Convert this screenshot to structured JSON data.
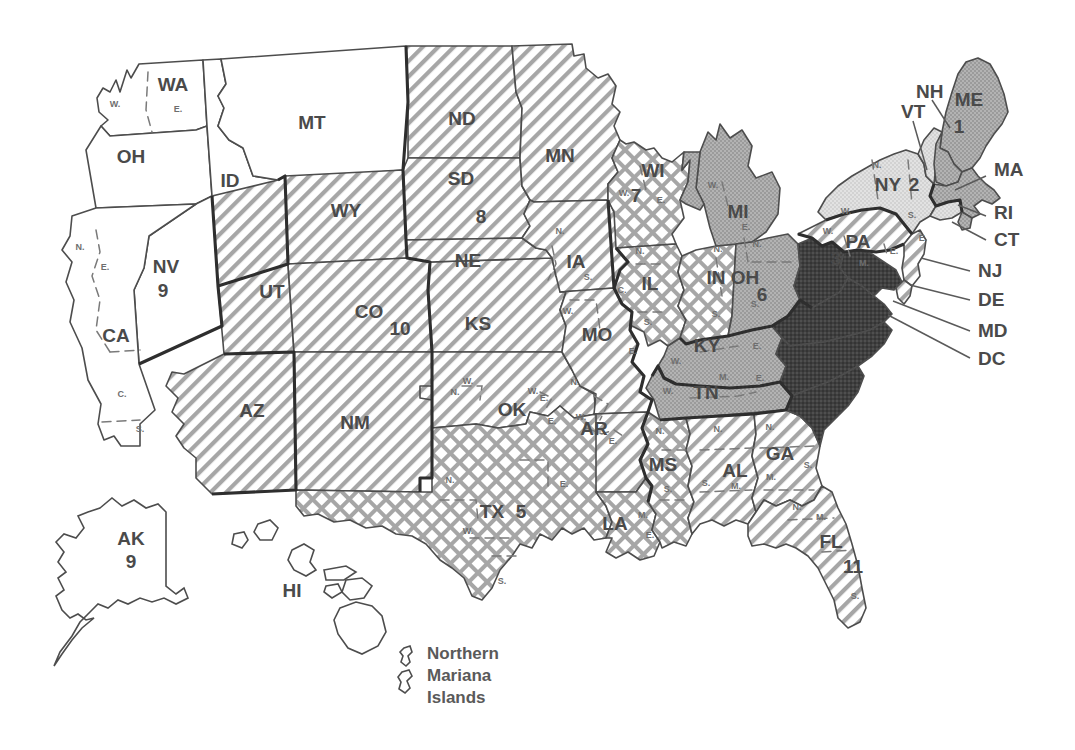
{
  "figure": {
    "kind": "map",
    "background_color": "#ffffff",
    "line_color": "#4d4d4d",
    "circuit_border_color": "#2e2e2e"
  },
  "fills": {
    "white": {
      "name": "plain-white",
      "color": "#ffffff"
    },
    "hatch": {
      "name": "diagonal-hatch",
      "color": "#9a9a9a"
    },
    "crosshatch": {
      "name": "cross-hatch",
      "color": "#9a9a9a"
    },
    "lightgray": {
      "name": "light-gray",
      "color": "#dcdcdc"
    },
    "midgray": {
      "name": "medium-gray",
      "color": "#a8a8a8"
    },
    "dark": {
      "name": "near-black",
      "color": "#3c3c3c"
    }
  },
  "circuits": [
    {
      "number": "1",
      "fill": "midgray",
      "states": [
        "ME",
        "NH",
        "MA",
        "RI",
        "PR"
      ]
    },
    {
      "number": "2",
      "fill": "lightgray",
      "states": [
        "NY",
        "VT",
        "CT"
      ]
    },
    {
      "number": "3",
      "fill": "hatch",
      "states": [
        "PA",
        "NJ",
        "DE"
      ]
    },
    {
      "number": "4",
      "fill": "dark",
      "states": [
        "WV",
        "VA",
        "MD",
        "DC",
        "NC",
        "SC"
      ]
    },
    {
      "number": "5",
      "fill": "crosshatch",
      "states": [
        "TX",
        "LA",
        "MS"
      ]
    },
    {
      "number": "6",
      "fill": "midgray",
      "states": [
        "MI",
        "OH",
        "KY",
        "TN"
      ]
    },
    {
      "number": "7",
      "fill": "crosshatch",
      "states": [
        "WI",
        "IL",
        "IN"
      ]
    },
    {
      "number": "8",
      "fill": "hatch",
      "states": [
        "ND",
        "SD",
        "NE",
        "MN",
        "IA",
        "MO",
        "AR"
      ]
    },
    {
      "number": "9",
      "fill": "white",
      "states": [
        "WA",
        "OR",
        "ID",
        "MT",
        "NV",
        "CA",
        "AK",
        "HI",
        "GU",
        "MP"
      ]
    },
    {
      "number": "10",
      "fill": "hatch",
      "states": [
        "WY",
        "UT",
        "CO",
        "NM",
        "AZ",
        "KS",
        "OK"
      ]
    },
    {
      "number": "11",
      "fill": "hatch",
      "states": [
        "AL",
        "GA",
        "FL"
      ]
    }
  ],
  "circuit_numbers": [
    {
      "label": "1",
      "x": 959,
      "y": 128
    },
    {
      "label": "2",
      "x": 914,
      "y": 186
    },
    {
      "label": "3",
      "x": 836,
      "y": 260
    },
    {
      "label": "5",
      "x": 521,
      "y": 513
    },
    {
      "label": "6",
      "x": 762,
      "y": 296
    },
    {
      "label": "7",
      "x": 636,
      "y": 197
    },
    {
      "label": "8",
      "x": 481,
      "y": 218
    },
    {
      "label": "9",
      "x": 163,
      "y": 292
    },
    {
      "label": "9",
      "x": 131,
      "y": 563
    },
    {
      "label": "10",
      "x": 400,
      "y": 330
    },
    {
      "label": "11",
      "x": 853,
      "y": 568
    }
  ],
  "state_labels": [
    {
      "abbr": "WA",
      "x": 173,
      "y": 86,
      "size": "lg"
    },
    {
      "abbr": "OH",
      "x": 131,
      "y": 158,
      "size": "lg"
    },
    {
      "abbr": "ID",
      "x": 230,
      "y": 182,
      "size": "lg"
    },
    {
      "abbr": "MT",
      "x": 312,
      "y": 124,
      "size": "lg"
    },
    {
      "abbr": "ND",
      "x": 462,
      "y": 120,
      "size": "lg"
    },
    {
      "abbr": "SD",
      "x": 461,
      "y": 180,
      "size": "lg"
    },
    {
      "abbr": "NE",
      "x": 468,
      "y": 262,
      "size": "lg"
    },
    {
      "abbr": "MN",
      "x": 560,
      "y": 157,
      "size": "lg"
    },
    {
      "abbr": "WY",
      "x": 346,
      "y": 212,
      "size": "lg"
    },
    {
      "abbr": "NV",
      "x": 166,
      "y": 268,
      "size": "lg"
    },
    {
      "abbr": "CA",
      "x": 116,
      "y": 337,
      "size": "lg"
    },
    {
      "abbr": "UT",
      "x": 272,
      "y": 293,
      "size": "lg"
    },
    {
      "abbr": "CO",
      "x": 369,
      "y": 313,
      "size": "lg"
    },
    {
      "abbr": "AZ",
      "x": 252,
      "y": 412,
      "size": "lg"
    },
    {
      "abbr": "NM",
      "x": 355,
      "y": 424,
      "size": "lg"
    },
    {
      "abbr": "KS",
      "x": 478,
      "y": 325,
      "size": "lg"
    },
    {
      "abbr": "OK",
      "x": 512,
      "y": 411,
      "size": "lg"
    },
    {
      "abbr": "TX",
      "x": 492,
      "y": 513,
      "size": "lg"
    },
    {
      "abbr": "IA",
      "x": 576,
      "y": 263,
      "size": "lg"
    },
    {
      "abbr": "MO",
      "x": 597,
      "y": 336,
      "size": "lg"
    },
    {
      "abbr": "AR",
      "x": 594,
      "y": 430,
      "size": "lg"
    },
    {
      "abbr": "LA",
      "x": 615,
      "y": 525,
      "size": "lg"
    },
    {
      "abbr": "WI",
      "x": 653,
      "y": 172,
      "size": "lg"
    },
    {
      "abbr": "IL",
      "x": 650,
      "y": 285,
      "size": "lg"
    },
    {
      "abbr": "IN",
      "x": 716,
      "y": 279,
      "size": "lg"
    },
    {
      "abbr": "MI",
      "x": 738,
      "y": 213,
      "size": "lg"
    },
    {
      "abbr": "OH",
      "x": 745,
      "y": 279,
      "size": "lg"
    },
    {
      "abbr": "KY",
      "x": 707,
      "y": 347,
      "size": "lg"
    },
    {
      "abbr": "TN",
      "x": 706,
      "y": 394,
      "size": "lg"
    },
    {
      "abbr": "MS",
      "x": 663,
      "y": 466,
      "size": "lg"
    },
    {
      "abbr": "AL",
      "x": 735,
      "y": 472,
      "size": "lg"
    },
    {
      "abbr": "GA",
      "x": 780,
      "y": 455,
      "size": "lg"
    },
    {
      "abbr": "FL",
      "x": 831,
      "y": 543,
      "size": "lg"
    },
    {
      "abbr": "PA",
      "x": 858,
      "y": 243,
      "size": "lg"
    },
    {
      "abbr": "NY",
      "x": 888,
      "y": 186,
      "size": "lg"
    },
    {
      "abbr": "ME",
      "x": 969,
      "y": 101,
      "size": "lg"
    },
    {
      "abbr": "AK",
      "x": 131,
      "y": 540,
      "size": "lg"
    },
    {
      "abbr": "HI",
      "x": 292,
      "y": 592,
      "size": "lg"
    }
  ],
  "callouts": [
    {
      "abbr": "NH",
      "tx": 916,
      "ty": 93,
      "lx1": 932,
      "ly1": 100,
      "lx2": 950,
      "ly2": 128
    },
    {
      "abbr": "VT",
      "tx": 901,
      "ty": 113,
      "lx1": 913,
      "ly1": 121,
      "lx2": 927,
      "ly2": 170
    },
    {
      "abbr": "MA",
      "tx": 994,
      "ty": 171,
      "lx1": 986,
      "ly1": 176,
      "lx2": 955,
      "ly2": 190
    },
    {
      "abbr": "RI",
      "tx": 994,
      "ty": 214,
      "lx1": 986,
      "ly1": 216,
      "lx2": 958,
      "ly2": 205
    },
    {
      "abbr": "CT",
      "tx": 994,
      "ty": 241,
      "lx1": 986,
      "ly1": 240,
      "lx2": 952,
      "ly2": 222
    },
    {
      "abbr": "NJ",
      "tx": 978,
      "ty": 272,
      "lx1": 970,
      "ly1": 271,
      "lx2": 921,
      "ly2": 258
    },
    {
      "abbr": "DE",
      "tx": 978,
      "ty": 301,
      "lx1": 970,
      "ly1": 300,
      "lx2": 910,
      "ly2": 285
    },
    {
      "abbr": "MD",
      "tx": 978,
      "ty": 332,
      "lx1": 970,
      "ly1": 331,
      "lx2": 893,
      "ly2": 301
    },
    {
      "abbr": "DC",
      "tx": 978,
      "ty": 360,
      "lx1": 970,
      "ly1": 358,
      "lx2": 888,
      "ly2": 315
    }
  ],
  "district_marks": [
    {
      "t": "W.",
      "x": 115,
      "y": 105
    },
    {
      "t": "E.",
      "x": 178,
      "y": 110
    },
    {
      "t": "N.",
      "x": 80,
      "y": 248
    },
    {
      "t": "E.",
      "x": 105,
      "y": 268
    },
    {
      "t": "C.",
      "x": 122,
      "y": 395
    },
    {
      "t": "S.",
      "x": 140,
      "y": 430
    },
    {
      "t": "N.",
      "x": 560,
      "y": 232
    },
    {
      "t": "S.",
      "x": 588,
      "y": 278
    },
    {
      "t": "W.",
      "x": 568,
      "y": 312
    },
    {
      "t": "E.",
      "x": 633,
      "y": 352
    },
    {
      "t": "W.",
      "x": 533,
      "y": 392
    },
    {
      "t": "E.",
      "x": 552,
      "y": 422
    },
    {
      "t": "N.",
      "x": 575,
      "y": 383
    },
    {
      "t": "W.",
      "x": 581,
      "y": 418
    },
    {
      "t": "E.",
      "x": 613,
      "y": 442
    },
    {
      "t": "N.",
      "x": 455,
      "y": 393
    },
    {
      "t": "W.",
      "x": 468,
      "y": 382
    },
    {
      "t": "E.",
      "x": 544,
      "y": 399
    },
    {
      "t": "N.",
      "x": 450,
      "y": 481
    },
    {
      "t": "W.",
      "x": 468,
      "y": 532
    },
    {
      "t": "E.",
      "x": 564,
      "y": 485
    },
    {
      "t": "S.",
      "x": 502,
      "y": 582
    },
    {
      "t": "W.",
      "x": 624,
      "y": 194
    },
    {
      "t": "E.",
      "x": 661,
      "y": 201
    },
    {
      "t": "N.",
      "x": 640,
      "y": 252
    },
    {
      "t": "C.",
      "x": 622,
      "y": 291
    },
    {
      "t": "S.",
      "x": 648,
      "y": 323
    },
    {
      "t": "N.",
      "x": 718,
      "y": 250
    },
    {
      "t": "S.",
      "x": 716,
      "y": 315
    },
    {
      "t": "W.",
      "x": 713,
      "y": 186
    },
    {
      "t": "E.",
      "x": 746,
      "y": 228
    },
    {
      "t": "N.",
      "x": 757,
      "y": 245
    },
    {
      "t": "S.",
      "x": 755,
      "y": 305
    },
    {
      "t": "W.",
      "x": 676,
      "y": 362
    },
    {
      "t": "E.",
      "x": 757,
      "y": 347
    },
    {
      "t": "W.",
      "x": 668,
      "y": 392
    },
    {
      "t": "M.",
      "x": 724,
      "y": 378
    },
    {
      "t": "E.",
      "x": 760,
      "y": 379
    },
    {
      "t": "N.",
      "x": 660,
      "y": 432
    },
    {
      "t": "S.",
      "x": 668,
      "y": 490
    },
    {
      "t": "M.",
      "x": 643,
      "y": 516
    },
    {
      "t": "E.",
      "x": 650,
      "y": 536
    },
    {
      "t": "N.",
      "x": 718,
      "y": 430
    },
    {
      "t": "M.",
      "x": 736,
      "y": 487
    },
    {
      "t": "S.",
      "x": 706,
      "y": 484
    },
    {
      "t": "N.",
      "x": 770,
      "y": 428
    },
    {
      "t": "M.",
      "x": 771,
      "y": 478
    },
    {
      "t": "S.",
      "x": 808,
      "y": 466
    },
    {
      "t": "N.",
      "x": 797,
      "y": 508
    },
    {
      "t": "M.",
      "x": 821,
      "y": 518
    },
    {
      "t": "S.",
      "x": 855,
      "y": 597
    },
    {
      "t": "W.",
      "x": 828,
      "y": 232
    },
    {
      "t": "M.",
      "x": 864,
      "y": 264
    },
    {
      "t": "E.",
      "x": 894,
      "y": 252
    },
    {
      "t": "N.",
      "x": 877,
      "y": 166
    },
    {
      "t": "W.",
      "x": 846,
      "y": 212
    },
    {
      "t": "S.",
      "x": 912,
      "y": 216
    },
    {
      "t": "E.",
      "x": 923,
      "y": 239
    }
  ],
  "northern_mariana": {
    "lines": [
      "Northern",
      "Mariana",
      "Islands"
    ],
    "text_x": 427,
    "text_y_start": 655,
    "line_height": 22
  }
}
